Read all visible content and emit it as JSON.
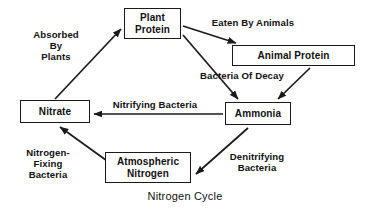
{
  "diagram": {
    "caption": "Nitrogen Cycle",
    "stroke_color": "#1a1a1a",
    "text_color": "#111111",
    "background_color": "#ffffff",
    "nodes": [
      {
        "id": "plant-protein",
        "label": "Plant\nProtein"
      },
      {
        "id": "animal-protein",
        "label": "Animal Protein"
      },
      {
        "id": "nitrate",
        "label": "Nitrate"
      },
      {
        "id": "ammonia",
        "label": "Ammonia"
      },
      {
        "id": "atmospheric-nitrogen",
        "label": "Atmospheric\nNitrogen"
      }
    ],
    "edges": [
      {
        "id": "nitrate-to-plant-protein",
        "from": "nitrate",
        "to": "plant-protein",
        "label": "Absorbed\nBy\nPlants"
      },
      {
        "id": "plant-protein-to-animal-protein",
        "from": "plant-protein",
        "to": "animal-protein",
        "label": "Eaten By Animals"
      },
      {
        "id": "plant-protein-to-ammonia",
        "from": "plant-protein",
        "to": "ammonia",
        "label": "Bacteria Of Decay"
      },
      {
        "id": "animal-protein-to-ammonia",
        "from": "animal-protein",
        "to": "ammonia",
        "label": ""
      },
      {
        "id": "ammonia-to-nitrate",
        "from": "ammonia",
        "to": "nitrate",
        "label": "Nitrifying Bacteria"
      },
      {
        "id": "atmospheric-nitrogen-to-nitrate",
        "from": "atmospheric-nitrogen",
        "to": "nitrate",
        "label": "Nitrogen-\nFixing\nBacteria"
      },
      {
        "id": "ammonia-to-atmospheric-nitrogen",
        "from": "ammonia",
        "to": "atmospheric-nitrogen",
        "label": "Denitrifying\nBacteria"
      }
    ]
  }
}
